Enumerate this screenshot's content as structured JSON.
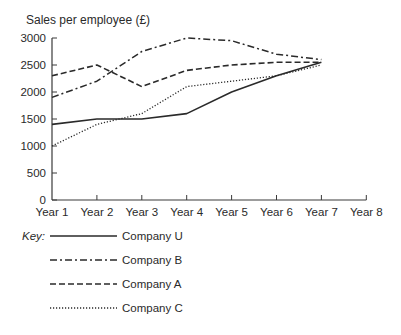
{
  "chart_data": {
    "type": "line",
    "title": "Sales per employee (£)",
    "xlabel": "",
    "ylabel": "Sales per employee (£)",
    "categories": [
      "Year 1",
      "Year 2",
      "Year 3",
      "Year 4",
      "Year 5",
      "Year 6",
      "Year 7",
      "Year 8"
    ],
    "yticks": [
      0,
      500,
      1000,
      1500,
      2000,
      2500,
      3000
    ],
    "ylim": [
      0,
      3000
    ],
    "grid": false,
    "legend_position": "bottom-left",
    "legend_title": "Key:",
    "series": [
      {
        "name": "Company U",
        "style": "solid",
        "values": [
          1400,
          1500,
          1500,
          1600,
          2000,
          2300,
          2550,
          null
        ]
      },
      {
        "name": "Company B",
        "style": "dash-dot",
        "values": [
          1900,
          2200,
          2750,
          3000,
          2950,
          2700,
          2600,
          null
        ]
      },
      {
        "name": "Company A",
        "style": "dashed",
        "values": [
          2300,
          2500,
          2100,
          2400,
          2500,
          2550,
          2550,
          null
        ]
      },
      {
        "name": "Company C",
        "style": "dotted",
        "values": [
          1000,
          1400,
          1600,
          2100,
          2200,
          2300,
          2500,
          null
        ]
      }
    ]
  },
  "layout": {
    "line_color": "#2a2a2a",
    "axis_color": "#3a3a3a"
  }
}
